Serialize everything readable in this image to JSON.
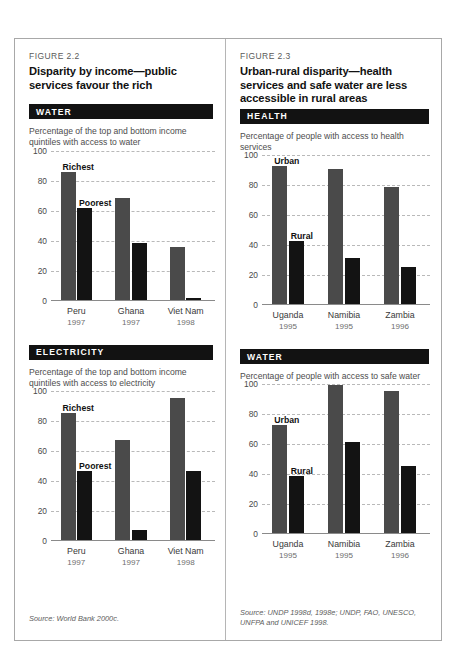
{
  "figures": [
    {
      "number": "FIGURE 2.2",
      "title": "Disparity by income—public services favour the rich",
      "source": "Source: World Bank 2000c.",
      "sections": [
        {
          "band": "WATER",
          "caption": "Percentage of the top and bottom income quintiles with access to water",
          "chart_data": {
            "type": "bar",
            "title": "Percentage of the top and bottom income quintiles with access to water",
            "xlabel": "",
            "ylabel": "",
            "ylim": [
              0,
              100
            ],
            "yticks": [
              0,
              20,
              40,
              60,
              80,
              100
            ],
            "grid": true,
            "categories": [
              "Peru",
              "Ghana",
              "Viet Nam"
            ],
            "category_years": [
              "1997",
              "1997",
              "1998"
            ],
            "series": [
              {
                "name": "Richest",
                "values": [
                  85,
                  68,
                  35
                ]
              },
              {
                "name": "Poorest",
                "values": [
                  61,
                  38,
                  1
                ]
              }
            ],
            "annotations": [
              "Richest",
              "Poorest"
            ]
          }
        },
        {
          "band": "ELECTRICITY",
          "caption": "Percentage of the top and bottom income quintiles with access to electricity",
          "chart_data": {
            "type": "bar",
            "title": "Percentage of the top and bottom income quintiles with access to electricity",
            "xlabel": "",
            "ylabel": "",
            "ylim": [
              0,
              100
            ],
            "yticks": [
              0,
              20,
              40,
              60,
              80,
              100
            ],
            "grid": true,
            "categories": [
              "Peru",
              "Ghana",
              "Viet Nam"
            ],
            "category_years": [
              "1997",
              "1997",
              "1998"
            ],
            "series": [
              {
                "name": "Richest",
                "values": [
                  85,
                  67,
                  95
                ]
              },
              {
                "name": "Poorest",
                "values": [
                  46,
                  7,
                  46
                ]
              }
            ],
            "annotations": [
              "Richest",
              "Poorest"
            ]
          }
        }
      ]
    },
    {
      "number": "FIGURE 2.3",
      "title": "Urban-rural disparity—health services and safe water are less accessible in rural areas",
      "source": "Source: UNDP 1998d, 1998e; UNDP, FAO, UNESCO, UNFPA and UNICEF 1998.",
      "sections": [
        {
          "band": "HEALTH",
          "caption": "Percentage of people with access to health services",
          "chart_data": {
            "type": "bar",
            "title": "Percentage of people with access to health services",
            "xlabel": "",
            "ylabel": "",
            "ylim": [
              0,
              100
            ],
            "yticks": [
              0,
              20,
              40,
              60,
              80,
              100
            ],
            "grid": true,
            "categories": [
              "Uganda",
              "Namibia",
              "Zambia"
            ],
            "category_years": [
              "1995",
              "1995",
              "1996"
            ],
            "series": [
              {
                "name": "Urban",
                "values": [
                  92,
                  90,
                  78
                ]
              },
              {
                "name": "Rural",
                "values": [
                  42,
                  31,
                  25
                ]
              }
            ],
            "annotations": [
              "Urban",
              "Rural"
            ]
          }
        },
        {
          "band": "WATER",
          "caption": "Percentage of people with access to safe water",
          "chart_data": {
            "type": "bar",
            "title": "Percentage of people with access to safe water",
            "xlabel": "",
            "ylabel": "",
            "ylim": [
              0,
              100
            ],
            "yticks": [
              0,
              20,
              40,
              60,
              80,
              100
            ],
            "grid": true,
            "categories": [
              "Uganda",
              "Namibia",
              "Zambia"
            ],
            "category_years": [
              "1995",
              "1995",
              "1996"
            ],
            "series": [
              {
                "name": "Urban",
                "values": [
                  72,
                  99,
                  95
                ]
              },
              {
                "name": "Rural",
                "values": [
                  38,
                  61,
                  45
                ]
              }
            ],
            "annotations": [
              "Urban",
              "Rural"
            ]
          }
        }
      ]
    }
  ],
  "colors": {
    "series_a": "#4a4a4a",
    "series_b": "#131313",
    "band_bg": "#121212",
    "band_text": "#ffffff",
    "grid": "#b9b9b9",
    "axis": "#8a8a8a",
    "frame": "#a8a8a8"
  }
}
